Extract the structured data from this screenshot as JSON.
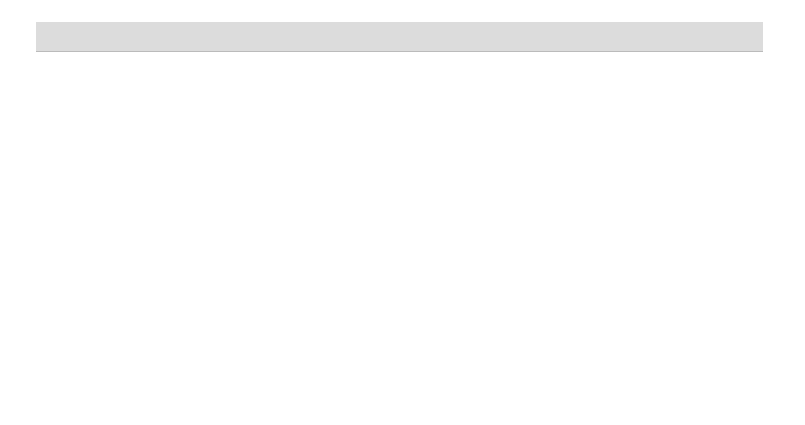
{
  "response": {
    "name": "Resistance",
    "value": "82.63333",
    "ci": "±26.83265"
  },
  "chart_data": {
    "type": "line",
    "ylabel": "Resistance",
    "ylim": [
      0,
      110
    ],
    "yticks": [
      0,
      20,
      40,
      60,
      80,
      100
    ],
    "reference_line": 82.63333,
    "panels": [
      {
        "factor": "Shape",
        "current": "Disk",
        "categories": [
          "Cone",
          "Cylinder",
          "Disk"
        ],
        "values": [
          19,
          31,
          82.6
        ],
        "lower": [
          0,
          5,
          56
        ],
        "upper": [
          46,
          58,
          109
        ]
      },
      {
        "factor": "Speed",
        "current": "Fast",
        "categories": [
          "Fast",
          "Intermediate",
          "Slow"
        ],
        "values": [
          82.6,
          76,
          71.5
        ],
        "lower": [
          56,
          49.5,
          45
        ],
        "upper": [
          109,
          103.5,
          98
        ]
      },
      {
        "factor": "Depth",
        "current": "Intermediate",
        "categories": [
          "High",
          "Intermediate",
          "Low"
        ],
        "values": [
          77.5,
          82.6,
          75.5
        ],
        "lower": [
          50,
          56,
          49
        ],
        "upper": [
          104,
          109,
          101.5
        ]
      }
    ]
  },
  "colors": {
    "line": "#333333",
    "errorbar": "#777777",
    "refline": "#999999",
    "header_bg": "#dcdcdc"
  }
}
